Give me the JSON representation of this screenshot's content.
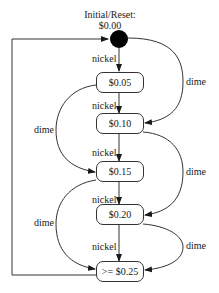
{
  "diagram": {
    "type": "state-machine",
    "initial_state": {
      "title_line1": "Initial/Reset:",
      "title_line2": "$0.00"
    },
    "states": [
      {
        "id": "s005",
        "label": "$0.05"
      },
      {
        "id": "s010",
        "label": "$0.10"
      },
      {
        "id": "s015",
        "label": "$0.15"
      },
      {
        "id": "s020",
        "label": "$0.20"
      },
      {
        "id": "s025",
        "label": ">= $0.25"
      }
    ],
    "transitions": [
      {
        "from": "$0.00",
        "to": "$0.05",
        "label": "nickel"
      },
      {
        "from": "$0.00",
        "to": "$0.10",
        "label": "dime"
      },
      {
        "from": "$0.05",
        "to": "$0.10",
        "label": "nickel"
      },
      {
        "from": "$0.05",
        "to": "$0.15",
        "label": "dime"
      },
      {
        "from": "$0.10",
        "to": "$0.15",
        "label": "nickel"
      },
      {
        "from": "$0.10",
        "to": "$0.20",
        "label": "dime"
      },
      {
        "from": "$0.15",
        "to": "$0.20",
        "label": "nickel"
      },
      {
        "from": "$0.15",
        "to": ">= $0.25",
        "label": "dime"
      },
      {
        "from": "$0.20",
        "to": ">= $0.25",
        "label": "nickel"
      },
      {
        "from": "$0.20",
        "to": ">= $0.25",
        "label": "dime"
      },
      {
        "from": ">= $0.25",
        "to": "$0.00",
        "label": ""
      }
    ],
    "edge_labels": {
      "nickel": "nickel",
      "dime": "dime"
    },
    "colors": {
      "line": "#333333",
      "initial_node": "#000000",
      "text": "#1a1a1a"
    }
  }
}
